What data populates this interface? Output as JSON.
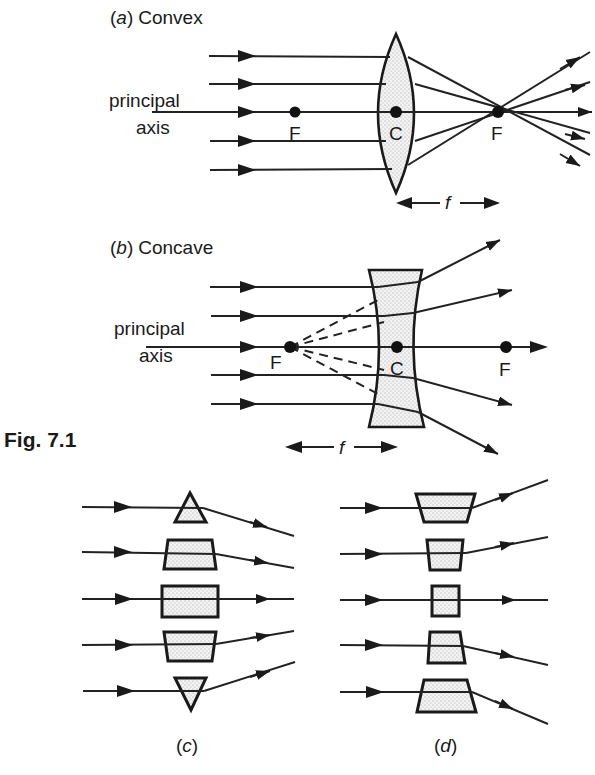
{
  "figure": {
    "caption": "Fig. 7.1",
    "panels": {
      "a": {
        "letter": "a",
        "title": "Convex",
        "axis_label_line1": "principal",
        "axis_label_line2": "axis",
        "left_focus": "F",
        "center": "C",
        "right_focus": "F",
        "focal_length": "f"
      },
      "b": {
        "letter": "b",
        "title": "Concave",
        "axis_label_line1": "principal",
        "axis_label_line2": "axis",
        "left_focus": "F",
        "center": "C",
        "right_focus": "F",
        "focal_length": "f"
      },
      "c": {
        "label": "(c)",
        "description": "stack of prisms/blocks approximating a convex lens"
      },
      "d": {
        "label": "(d)",
        "description": "stack of prisms/blocks approximating a concave lens"
      }
    },
    "paren_open": "(",
    "paren_close": ")"
  },
  "colors": {
    "ink": "#1a1a1a",
    "fill_dots": "#9a9a9a",
    "background": "#ffffff"
  }
}
